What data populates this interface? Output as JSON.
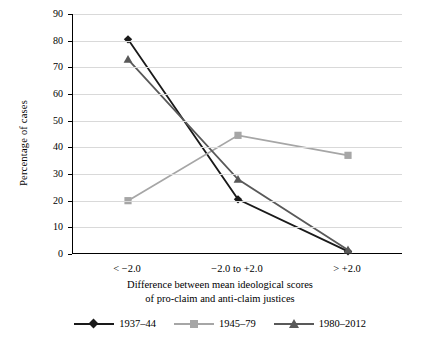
{
  "chart_data": {
    "type": "line",
    "title": "",
    "xlabel": "Difference between mean ideological scores of pro-claim and anti-claim justices",
    "xlabel_line1": "Difference between mean ideological scores",
    "xlabel_line2": "of pro-claim and anti-claim justices",
    "ylabel": "Percentage of cases",
    "categories": [
      "< −2.0",
      "−2.0 to +2.0",
      "> +2.0"
    ],
    "ylim": [
      0,
      90
    ],
    "yticks": [
      0,
      10,
      20,
      30,
      40,
      50,
      60,
      70,
      80,
      90
    ],
    "grid": true,
    "legend_position": "bottom",
    "series": [
      {
        "name": "1937–44",
        "color": "#1a1a1a",
        "marker": "diamond",
        "values": [
          80.5,
          20.5,
          1.0
        ]
      },
      {
        "name": "1945–79",
        "color": "#a6a6a6",
        "marker": "square",
        "values": [
          20.0,
          44.5,
          37.0
        ]
      },
      {
        "name": "1980–2012",
        "color": "#595959",
        "marker": "triangle",
        "values": [
          73.0,
          28.0,
          1.5
        ]
      }
    ]
  }
}
